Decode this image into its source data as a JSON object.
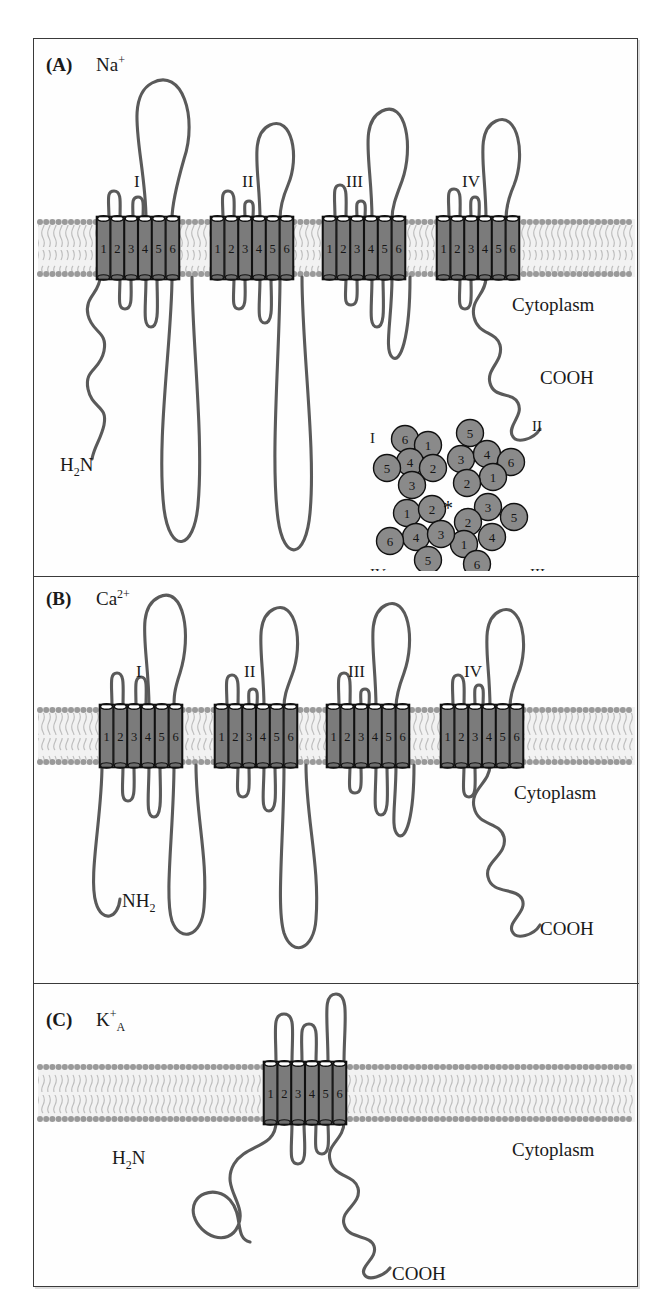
{
  "figure": {
    "border_color": "#3a3a3a",
    "background": "#fefefe"
  },
  "style_colors": {
    "chain_stroke": "#5a5a5a",
    "cylinder_fill": "#7b7b7b",
    "cylinder_outline": "#111111",
    "membrane_head": "#9a9a9a",
    "membrane_tail": "#bdbdbd",
    "membrane_core": "#f2f2f2",
    "pore_circle_fill": "#8a8a8a",
    "text": "#1a1a1a"
  },
  "panels": [
    {
      "id": "A",
      "letter": "(A)",
      "ion": "Na",
      "ion_superscript": "+",
      "ion_subscript": "",
      "cytoplasm_label": "Cytoplasm",
      "n_terminus": "H",
      "n_terminus_sub": "2",
      "n_terminus_tail": "N",
      "c_terminus": "COOH",
      "domains": [
        {
          "roman": "I",
          "segments": [
            "1",
            "2",
            "3",
            "4",
            "5",
            "6"
          ]
        },
        {
          "roman": "II",
          "segments": [
            "1",
            "2",
            "3",
            "4",
            "5",
            "6"
          ]
        },
        {
          "roman": "III",
          "segments": [
            "1",
            "2",
            "3",
            "4",
            "5",
            "6"
          ]
        },
        {
          "roman": "IV",
          "segments": [
            "1",
            "2",
            "3",
            "4",
            "5",
            "6"
          ]
        }
      ]
    },
    {
      "id": "B",
      "letter": "(B)",
      "ion": "Ca",
      "ion_superscript": "2+",
      "ion_subscript": "",
      "cytoplasm_label": "Cytoplasm",
      "n_terminus": "NH",
      "n_terminus_sub": "2",
      "n_terminus_tail": "",
      "c_terminus": "COOH",
      "domains": [
        {
          "roman": "I",
          "segments": [
            "1",
            "2",
            "3",
            "4",
            "5",
            "6"
          ]
        },
        {
          "roman": "II",
          "segments": [
            "1",
            "2",
            "3",
            "4",
            "5",
            "6"
          ]
        },
        {
          "roman": "III",
          "segments": [
            "1",
            "2",
            "3",
            "4",
            "5",
            "6"
          ]
        },
        {
          "roman": "IV",
          "segments": [
            "1",
            "2",
            "3",
            "4",
            "5",
            "6"
          ]
        }
      ]
    },
    {
      "id": "C",
      "letter": "(C)",
      "ion": "K",
      "ion_superscript": "+",
      "ion_subscript": "A",
      "cytoplasm_label": "Cytoplasm",
      "n_terminus": "H",
      "n_terminus_sub": "2",
      "n_terminus_tail": "N",
      "c_terminus": "COOH",
      "domains": [
        {
          "roman": "",
          "segments": [
            "1",
            "2",
            "3",
            "4",
            "5",
            "6"
          ]
        }
      ]
    }
  ],
  "inset": {
    "name": "pore-cross-section",
    "center_marker": "*",
    "domain_labels": [
      "I",
      "II",
      "III",
      "IV"
    ],
    "circles": [
      {
        "n": "6",
        "cx": 41,
        "cy": 22,
        "domain": "I"
      },
      {
        "n": "1",
        "cx": 64,
        "cy": 28,
        "domain": "I"
      },
      {
        "n": "4",
        "cx": 46,
        "cy": 45,
        "domain": "I"
      },
      {
        "n": "2",
        "cx": 69,
        "cy": 51,
        "domain": "I"
      },
      {
        "n": "5",
        "cx": 23,
        "cy": 51,
        "domain": "I"
      },
      {
        "n": "3",
        "cx": 48,
        "cy": 68,
        "domain": "I"
      },
      {
        "n": "5",
        "cx": 106,
        "cy": 16,
        "domain": "II"
      },
      {
        "n": "3",
        "cx": 97,
        "cy": 42,
        "domain": "II"
      },
      {
        "n": "4",
        "cx": 123,
        "cy": 37,
        "domain": "II"
      },
      {
        "n": "6",
        "cx": 147,
        "cy": 45,
        "domain": "II"
      },
      {
        "n": "1",
        "cx": 129,
        "cy": 60,
        "domain": "II"
      },
      {
        "n": "2",
        "cx": 103,
        "cy": 66,
        "domain": "II"
      },
      {
        "n": "3",
        "cx": 124,
        "cy": 90,
        "domain": "III"
      },
      {
        "n": "5",
        "cx": 150,
        "cy": 100,
        "domain": "III"
      },
      {
        "n": "2",
        "cx": 104,
        "cy": 105,
        "domain": "III"
      },
      {
        "n": "4",
        "cx": 128,
        "cy": 120,
        "domain": "III"
      },
      {
        "n": "1",
        "cx": 100,
        "cy": 127,
        "domain": "III"
      },
      {
        "n": "6",
        "cx": 113,
        "cy": 147,
        "domain": "III"
      },
      {
        "n": "1",
        "cx": 43,
        "cy": 96,
        "domain": "IV"
      },
      {
        "n": "2",
        "cx": 68,
        "cy": 92,
        "domain": "IV"
      },
      {
        "n": "4",
        "cx": 52,
        "cy": 120,
        "domain": "IV"
      },
      {
        "n": "3",
        "cx": 77,
        "cy": 117,
        "domain": "IV"
      },
      {
        "n": "6",
        "cx": 26,
        "cy": 124,
        "domain": "IV"
      },
      {
        "n": "5",
        "cx": 64,
        "cy": 143,
        "domain": "IV"
      }
    ]
  }
}
